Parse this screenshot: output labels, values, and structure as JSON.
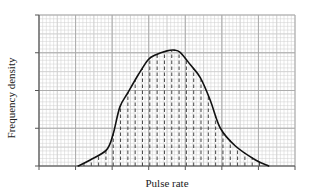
{
  "chart_data": {
    "type": "area",
    "title": "",
    "xlabel": "Pulse rate",
    "ylabel": "Frequency density",
    "x_tick_labels": [],
    "y_tick_labels": [],
    "x_major_ticks": 8,
    "y_major_ticks": 5,
    "xlim": [
      0,
      7
    ],
    "ylim": [
      0,
      4
    ],
    "grid": true,
    "grid_minor_divisions": 10,
    "legend": null,
    "curve": {
      "x": [
        1.07,
        1.4,
        1.84,
        2.02,
        2.21,
        2.43,
        2.71,
        2.98,
        3.18,
        3.5,
        3.7,
        3.86,
        4.14,
        4.41,
        4.68,
        4.96,
        5.37,
        5.92,
        6.28
      ],
      "y": [
        0.0,
        0.16,
        0.42,
        0.82,
        1.56,
        1.94,
        2.41,
        2.81,
        2.94,
        3.05,
        3.07,
        3.01,
        2.68,
        2.34,
        1.75,
        1.0,
        0.53,
        0.16,
        0.0
      ]
    },
    "dashed_strips": {
      "x_start": 1.23,
      "x_end": 6.04,
      "spacing": 0.2
    },
    "colors": {
      "grid_minor": "#cfcfcf",
      "grid_major": "#a8a8a8",
      "axis": "#555555",
      "curve": "#111111",
      "dashed": "#333333"
    }
  }
}
